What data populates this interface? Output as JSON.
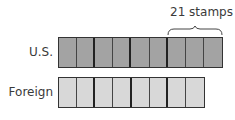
{
  "rows": [
    {
      "label": "U.S.",
      "count": 9,
      "fill": "#a3a3a3"
    },
    {
      "label": "Foreign",
      "count": 8,
      "fill": "#d8d8d8"
    }
  ],
  "annotation": {
    "text": "21 stamps",
    "spans_last": 3
  }
}
